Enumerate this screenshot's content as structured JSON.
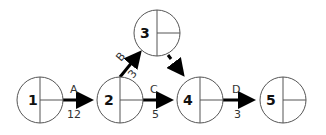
{
  "diagram": {
    "type": "activity-on-arrow network",
    "nodes": [
      {
        "id": "1",
        "label": "1",
        "cx": 40,
        "cy": 100
      },
      {
        "id": "2",
        "label": "2",
        "cx": 120,
        "cy": 100
      },
      {
        "id": "3",
        "label": "3",
        "cx": 157,
        "cy": 33
      },
      {
        "id": "4",
        "label": "4",
        "cx": 200,
        "cy": 100
      },
      {
        "id": "5",
        "label": "5",
        "cx": 283,
        "cy": 100
      }
    ],
    "activities": [
      {
        "name": "A",
        "duration": "12",
        "from": "1",
        "to": "2"
      },
      {
        "name": "B",
        "duration": "3",
        "from": "2",
        "to": "3"
      },
      {
        "name": "C",
        "duration": "5",
        "from": "2",
        "to": "4"
      },
      {
        "name": "D",
        "duration": "3",
        "from": "4",
        "to": "5"
      }
    ],
    "dummy": {
      "from": "3",
      "to": "4",
      "style": "dashed"
    }
  }
}
